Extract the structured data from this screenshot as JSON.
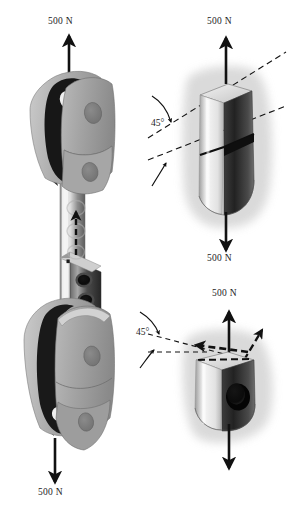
{
  "figure": {
    "type": "engineering-illustration",
    "background_color": "#ffffff"
  },
  "palette": {
    "ink": "#1a1a1a",
    "line": "#111111",
    "light_gray": "#c9c9c9",
    "mid_gray": "#9a9a9a",
    "dark_gray": "#5a5a5a",
    "near_black": "#1d1d1d",
    "halo_gray": "#d6d6d6",
    "highlight": "#efefef",
    "paper": "#ffffff"
  },
  "panels": {
    "main": {
      "name": "clevis-rod-assembly",
      "description": "Fork (clevis) joint at top and bottom connected by a pinned rod, pulled apart in tension"
    },
    "detail_upper": {
      "name": "rod-section-detail",
      "description": "Rod cut on a 45 degree inclined plane showing the elliptical cross section"
    },
    "detail_lower": {
      "name": "pin-hole-section-detail",
      "description": "Rod end with pin hole cut on a 45 degree plane showing resolved force arrow"
    }
  },
  "labels": {
    "force_top_left": "500 N",
    "force_bottom_left": "500 N",
    "force_top_right": "500 N",
    "force_bottom_right": "500 N",
    "force_lower_detail_top": "500 N",
    "angle_upper": "45°",
    "angle_lower": "45°"
  },
  "forces": [
    {
      "label": "500 N",
      "direction": "up",
      "location": "top of upper clevis",
      "panel": "main"
    },
    {
      "label": "500 N",
      "direction": "down",
      "location": "bottom of lower clevis",
      "panel": "main"
    },
    {
      "label": "500 N",
      "direction": "up",
      "location": "top of rod section",
      "panel": "detail_upper"
    },
    {
      "label": "500 N",
      "direction": "down",
      "location": "bottom of rod section",
      "panel": "detail_upper"
    },
    {
      "label": "500 N",
      "direction": "up",
      "location": "top of pin-hole block",
      "panel": "detail_lower"
    },
    {
      "label": "500 N",
      "direction": "down",
      "location": "bottom of pin-hole block",
      "panel": "detail_lower"
    }
  ],
  "annotations": {
    "internal_force_arrow": "dashed arrow along rod axis indicating internal tensile force",
    "section_plane_upper": "dashed inclined line at 45 degrees through the rod",
    "section_plane_lower": "dashed inclined line at 45 degrees through the pin hole region",
    "resolved_arrow": "short solid arrow normal to the inclined cut plane"
  }
}
